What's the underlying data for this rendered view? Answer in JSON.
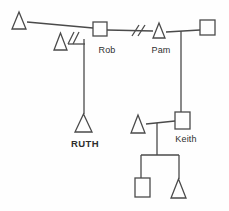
{
  "diagram": {
    "type": "genogram-family-diagram",
    "background_color": "#fefefe",
    "line_color": "#4a4a4a",
    "text_color": "#2e2e2e",
    "labels": {
      "rob": "Rob",
      "pam": "Pam",
      "ruth": "RUTH",
      "keith": "Keith"
    },
    "nodes": [
      {
        "id": "triangle-top-left",
        "shape": "triangle",
        "x": 12,
        "y": 12,
        "w": 14,
        "h": 17
      },
      {
        "id": "square-rob",
        "shape": "square",
        "x": 93,
        "y": 22,
        "w": 14,
        "h": 14,
        "label": "Rob"
      },
      {
        "id": "triangle-separated",
        "shape": "triangle",
        "x": 54,
        "y": 33,
        "w": 13,
        "h": 17
      },
      {
        "id": "triangle-pam",
        "shape": "triangle",
        "x": 153,
        "y": 23,
        "w": 12,
        "h": 15,
        "label": "Pam"
      },
      {
        "id": "square-top-right",
        "shape": "square",
        "x": 200,
        "y": 20,
        "w": 15,
        "h": 15
      },
      {
        "id": "triangle-ruth",
        "shape": "triangle",
        "x": 75,
        "y": 114,
        "w": 17,
        "h": 18,
        "label": "RUTH"
      },
      {
        "id": "triangle-keith-partner",
        "shape": "triangle",
        "x": 131,
        "y": 115,
        "w": 14,
        "h": 18
      },
      {
        "id": "square-keith",
        "shape": "square",
        "x": 175,
        "y": 112,
        "w": 15,
        "h": 17,
        "label": "Keith"
      },
      {
        "id": "square-grandchild",
        "shape": "square",
        "x": 135,
        "y": 178,
        "w": 15,
        "h": 19
      },
      {
        "id": "triangle-grandchild",
        "shape": "triangle",
        "x": 171,
        "y": 179,
        "w": 15,
        "h": 19
      }
    ],
    "edges": [
      {
        "id": "union-topleft-rob",
        "points": [
          [
            27,
            22
          ],
          [
            93,
            28
          ]
        ]
      },
      {
        "id": "union-rob-pam",
        "points": [
          [
            107,
            30
          ],
          [
            153,
            31
          ]
        ]
      },
      {
        "id": "union-pam-topright",
        "points": [
          [
            166,
            32
          ],
          [
            200,
            30
          ]
        ]
      },
      {
        "id": "drop-pam-to-keith",
        "points": [
          [
            181,
            31
          ],
          [
            181,
            112
          ]
        ]
      },
      {
        "id": "union-rob-separated",
        "points": [
          [
            68,
            44
          ],
          [
            85,
            44
          ]
        ]
      },
      {
        "id": "drop-to-ruth",
        "points": [
          [
            84,
            39
          ],
          [
            84,
            114
          ]
        ]
      },
      {
        "id": "union-keith-partner",
        "points": [
          [
            146,
            124
          ],
          [
            175,
            121
          ]
        ]
      },
      {
        "id": "drop-keith-children",
        "points": [
          [
            157,
            123
          ],
          [
            157,
            155
          ]
        ]
      },
      {
        "id": "sibling-bar",
        "points": [
          [
            141,
            155
          ],
          [
            179,
            155
          ]
        ]
      },
      {
        "id": "drop-grandchild-square",
        "points": [
          [
            141,
            155
          ],
          [
            141,
            178
          ]
        ]
      },
      {
        "id": "drop-grandchild-triangle",
        "points": [
          [
            179,
            155
          ],
          [
            179,
            179
          ]
        ]
      }
    ],
    "separation_marks": [
      {
        "id": "slashes-rob-pam",
        "lines": [
          [
            [
              132,
              36
            ],
            [
              139,
              25
            ]
          ],
          [
            [
              138,
              36
            ],
            [
              145,
              25
            ]
          ]
        ]
      },
      {
        "id": "slashes-rob-separated",
        "lines": [
          [
            [
              68,
              44
            ],
            [
              74,
              32
            ]
          ],
          [
            [
              73,
              44
            ],
            [
              79,
              32
            ]
          ]
        ]
      }
    ]
  }
}
